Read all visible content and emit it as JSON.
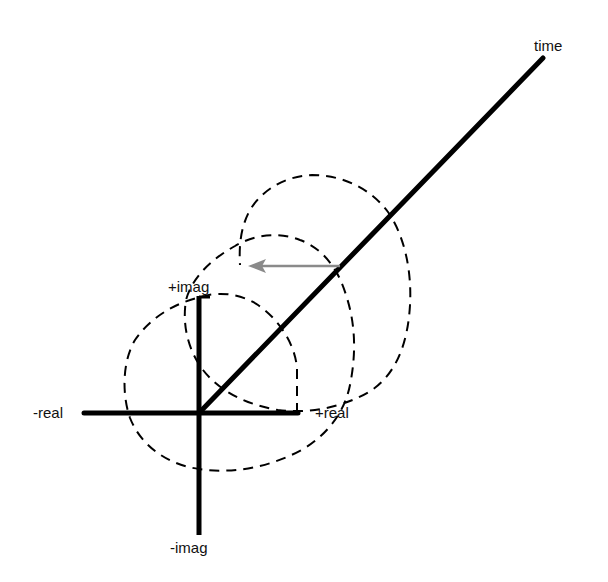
{
  "diagram": {
    "type": "complex-exponential-helix",
    "labels": {
      "time": "time",
      "plus_imag": "+imag",
      "minus_imag": "-imag",
      "plus_real": "+real",
      "minus_real": "-real"
    },
    "colors": {
      "axis": "#000000",
      "spiral": "#000000",
      "arrow": "#8a8a8a",
      "background": "#ffffff"
    },
    "elements": {
      "real_axis": "horizontal axis",
      "imag_axis": "vertical axis",
      "time_axis": "diagonal axis",
      "spiral": "dashed helix",
      "projection_arrow": "gray arrow pointing left"
    }
  }
}
